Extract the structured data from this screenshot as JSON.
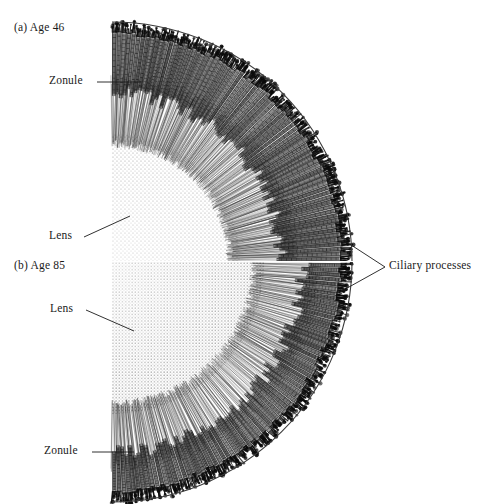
{
  "figure": {
    "kind": "anatomical-diagram",
    "background_color": "#ffffff",
    "ink_color": "#111111",
    "panels": [
      {
        "id": "a",
        "title": "(a)  Age 46",
        "age": 46,
        "labels": [
          "Zonule",
          "Lens"
        ],
        "description": "Younger eye: wide circumlental space, long slender ciliary processes, zonular fibres run a long distance from ciliary body to lens equator."
      },
      {
        "id": "b",
        "title": "(b)  Age 85",
        "age": 85,
        "labels": [
          "Lens",
          "Zonule"
        ],
        "description": "Older eye: lens is larger, circumlental space is narrowed, ciliary processes appear crowded and displaced forward toward the lens."
      }
    ],
    "shared_labels": [
      {
        "text": "Ciliary processes",
        "points_to": [
          "panel-a-ciliary-body",
          "panel-b-ciliary-body"
        ],
        "bracket": "V-shaped leader converging to the right"
      }
    ]
  },
  "panel_a": {
    "title": "(a)  Age 46",
    "zonule_label": "Zonule",
    "lens_label": "Lens"
  },
  "panel_b": {
    "title": "(b)  Age 85",
    "lens_label": "Lens",
    "zonule_label": "Zonule"
  },
  "annotations": {
    "ciliary_processes": "Ciliary processes"
  },
  "geometry": {
    "midline_x": 112,
    "panel_a": {
      "center_x": 112,
      "center_y": 262,
      "sclera_radius": 240,
      "ciliary_outer_radius": 232,
      "ciliary_inner_radius": 168,
      "lens_radius": 128,
      "process_count": 74,
      "zonule_inner_radius": 126,
      "zonule_outer_radius": 178
    },
    "panel_b": {
      "center_x": 112,
      "center_y": 262,
      "sclera_radius": 240,
      "ciliary_outer_radius": 232,
      "ciliary_inner_radius": 190,
      "lens_radius": 152,
      "process_count": 74,
      "zonule_inner_radius": 150,
      "zonule_outer_radius": 198
    }
  }
}
